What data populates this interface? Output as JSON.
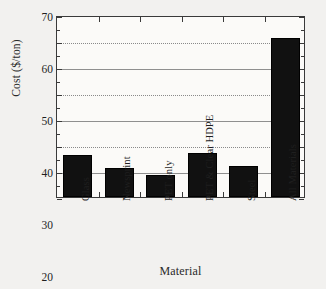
{
  "chart_data": {
    "type": "bar",
    "title": "",
    "xlabel": "Material",
    "ylabel": "Cost ($/ton)",
    "categories": [
      "Glass",
      "Newsprint",
      "PET only",
      "PET & Clear HDPE",
      "Steel",
      "All Materials"
    ],
    "values": [
      16,
      11,
      8.5,
      17,
      12,
      61
    ],
    "ylim": [
      0,
      70
    ],
    "ytick_labels": [
      "0",
      "10",
      "20",
      "30",
      "40",
      "50",
      "60",
      "70"
    ],
    "ytick_values": [
      0,
      10,
      20,
      30,
      40,
      50,
      60,
      70
    ],
    "grid": "horizontal",
    "legend": "none",
    "bar_color": "#111111",
    "axis_color": "#3a3a3a",
    "grid_color": "#8a8a8a",
    "background": "#f2f1ef",
    "plot_background": "#fbfaf8"
  }
}
